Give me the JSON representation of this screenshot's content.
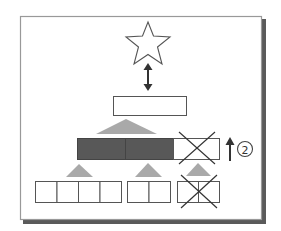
{
  "diagram": {
    "colors": {
      "frame_border": "#888888",
      "frame_shadow": "#555555",
      "outline": "#555555",
      "dark_fill": "#555555",
      "triangle_fill": "#aaaaaa",
      "cross": "#333333",
      "arrow": "#333333"
    },
    "nodes": {
      "star": {
        "shape": "star",
        "label": ""
      },
      "top_box": {
        "shape": "rect",
        "label": ""
      },
      "middle_bar": {
        "segments": 3,
        "filled_segments": 2,
        "crossed_segment": 3
      },
      "bottom_groups": [
        {
          "cells": 4,
          "crossed": false
        },
        {
          "cells": 2,
          "crossed": false
        },
        {
          "cells": 2,
          "crossed": true
        }
      ]
    },
    "connectors": {
      "star_to_box": "double-arrow-vertical"
    },
    "annotation": {
      "arrow": "up-arrow",
      "label": "②"
    }
  }
}
